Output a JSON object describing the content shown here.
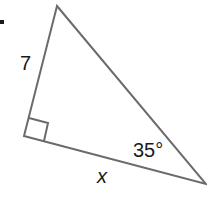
{
  "figure": {
    "marker": ".",
    "side_label_left": "7",
    "side_label_bottom": "x",
    "angle_label": "35°",
    "line_color": "#6b6b6b",
    "text_color": "#1a1a1a",
    "vertices": {
      "top": [
        57,
        6
      ],
      "right_angle": [
        24,
        136
      ],
      "bottom_right": [
        206,
        184
      ]
    }
  }
}
